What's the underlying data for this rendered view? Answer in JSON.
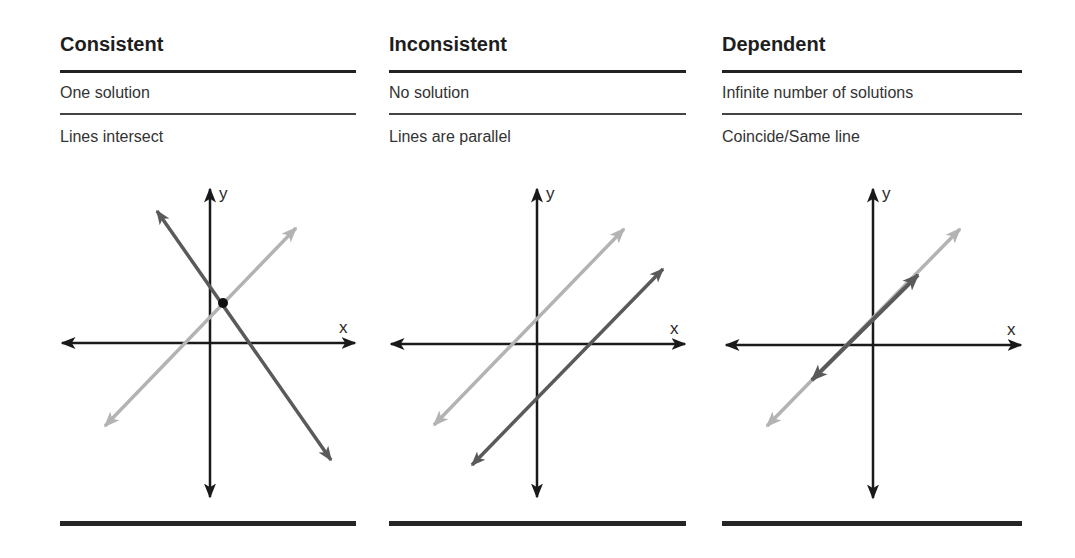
{
  "columns": [
    {
      "title": "Consistent",
      "row1": "One solution",
      "row2": "Lines intersect",
      "x_label": "x",
      "y_label": "y"
    },
    {
      "title": "Inconsistent",
      "row1": "No solution",
      "row2": "Lines are parallel",
      "x_label": "x",
      "y_label": "y"
    },
    {
      "title": "Dependent",
      "row1": "Infinite number of solutions",
      "row2": "Coincide/Same line",
      "x_label": "x",
      "y_label": "y"
    }
  ],
  "colors": {
    "axis": "#1a1a1a",
    "dark_line": "#5a5a5a",
    "light_line": "#b3b3b3",
    "point": "#111111"
  }
}
